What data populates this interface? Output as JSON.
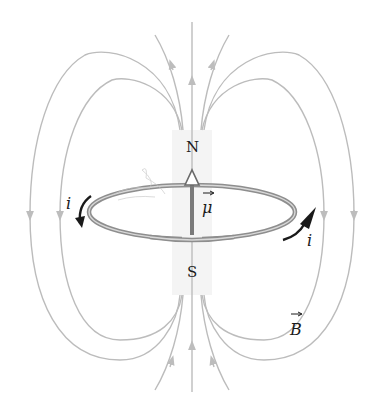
{
  "diagram": {
    "labels": {
      "north_pole": "N",
      "south_pole": "S",
      "dipole_moment": "μ",
      "current_left": "i",
      "current_right": "i",
      "field": "B"
    },
    "colors": {
      "field_lines": "#b8b8b8",
      "loop": "#8c8c8c",
      "current_arrow": "#1a1a1a",
      "dipole_arrow": "#7a7a7a",
      "magnet_region": "#f3f3f3",
      "text": "#1a1a1a"
    },
    "elements": [
      {
        "type": "field-lines",
        "count": 9,
        "direction": "emerge from N, return to S"
      },
      {
        "type": "current-loop",
        "shape": "ellipse"
      },
      {
        "type": "dipole-moment-arrow",
        "direction": "up"
      },
      {
        "type": "current-arrow",
        "side": "left",
        "direction": "counterclockwise-down"
      },
      {
        "type": "current-arrow",
        "side": "right",
        "direction": "up"
      }
    ]
  }
}
